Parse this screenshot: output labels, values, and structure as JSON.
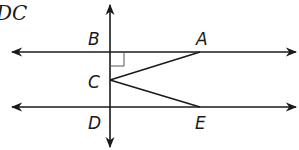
{
  "header": {
    "text": "DC"
  },
  "diagram": {
    "colors": {
      "stroke": "#1a1a1a",
      "background": "#ffffff"
    },
    "points": {
      "B": {
        "label": "B",
        "x": 110,
        "y": 52
      },
      "A": {
        "label": "A",
        "x": 200,
        "y": 52
      },
      "C": {
        "label": "C",
        "x": 110,
        "y": 80
      },
      "D": {
        "label": "D",
        "x": 110,
        "y": 107
      },
      "E": {
        "label": "E",
        "x": 200,
        "y": 107
      }
    },
    "lines": [
      {
        "name": "line-BA",
        "type": "line",
        "from": [
          12,
          52
        ],
        "to": [
          297,
          52
        ]
      },
      {
        "name": "line-DE",
        "type": "line",
        "from": [
          12,
          107
        ],
        "to": [
          297,
          107
        ]
      },
      {
        "name": "line-BD",
        "type": "line",
        "from": [
          110,
          4
        ],
        "to": [
          110,
          148
        ]
      }
    ],
    "segments": [
      {
        "name": "segment-CA",
        "from": "C",
        "to": "A"
      },
      {
        "name": "segment-CE",
        "from": "C",
        "to": "E"
      }
    ],
    "right_angle_at": "B"
  }
}
